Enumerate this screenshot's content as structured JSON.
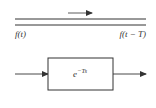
{
  "diagram": {
    "title": "",
    "line": {
      "input_label": "f(t)",
      "output_label": "f(t − T)",
      "direction": "right"
    },
    "block": {
      "base": "e",
      "exponent": "−Ts",
      "input_arrow": "right",
      "output_arrow": "right"
    },
    "colors": {
      "stroke": "#333333",
      "background": "#ffffff"
    }
  }
}
